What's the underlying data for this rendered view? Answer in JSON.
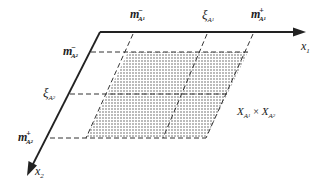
{
  "diagram": {
    "axes": {
      "x1": {
        "label": "x",
        "subscript": "1"
      },
      "x2": {
        "label": "x",
        "subscript": "2"
      }
    },
    "x1_markers": [
      {
        "id": "m_A1_minus",
        "symbol": "m",
        "subscript": "A",
        "subsub": "1",
        "superscript": "−"
      },
      {
        "id": "xi_A1",
        "symbol": "ξ",
        "subscript": "A",
        "subsub": "1",
        "superscript": ""
      },
      {
        "id": "m_A1_plus",
        "symbol": "m",
        "subscript": "A",
        "subsub": "1",
        "superscript": "+"
      }
    ],
    "x2_markers": [
      {
        "id": "m_A2_minus",
        "symbol": "m",
        "subscript": "A",
        "subsub": "2",
        "superscript": "−"
      },
      {
        "id": "xi_A2",
        "symbol": "ξ",
        "subscript": "A",
        "subsub": "2",
        "superscript": ""
      },
      {
        "id": "m_A2_plus",
        "symbol": "m",
        "subscript": "A",
        "subsub": "2",
        "superscript": "+"
      }
    ],
    "region_label": {
      "left": "X",
      "left_sub": "A",
      "left_subsub": "1",
      "op": "×",
      "right": "X",
      "right_sub": "A",
      "right_subsub": "2"
    },
    "colors": {
      "axis": "#222222",
      "dash": "#333333",
      "shade_dot": "#555555",
      "background": "#ffffff"
    }
  }
}
